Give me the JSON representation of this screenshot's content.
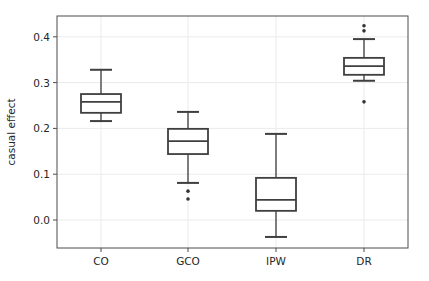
{
  "chart_data": {
    "type": "box",
    "title": "",
    "xlabel": "",
    "ylabel": "casual effect",
    "categories": [
      "CO",
      "GCO",
      "IPW",
      "DR"
    ],
    "ylim": [
      -0.06,
      0.445
    ],
    "yticks": [
      0.0,
      0.1,
      0.2,
      0.3,
      0.4
    ],
    "ytick_labels": [
      "0.0",
      "0.1",
      "0.2",
      "0.3",
      "0.4"
    ],
    "grid": true,
    "legend": null,
    "series": [
      {
        "name": "CO",
        "whisker_low": 0.216,
        "q1": 0.234,
        "median": 0.258,
        "q3": 0.275,
        "whisker_high": 0.328,
        "outliers": []
      },
      {
        "name": "GCO",
        "whisker_low": 0.081,
        "q1": 0.144,
        "median": 0.172,
        "q3": 0.199,
        "whisker_high": 0.236,
        "outliers": [
          0.063,
          0.046
        ]
      },
      {
        "name": "IPW",
        "whisker_low": -0.037,
        "q1": 0.02,
        "median": 0.044,
        "q3": 0.092,
        "whisker_high": 0.188,
        "outliers": []
      },
      {
        "name": "DR",
        "whisker_low": 0.304,
        "q1": 0.317,
        "median": 0.336,
        "q3": 0.354,
        "whisker_high": 0.395,
        "outliers": [
          0.424,
          0.413,
          0.258
        ]
      }
    ],
    "colors": {
      "box": "#3f3f3f",
      "whisker": "#555555",
      "grid": "#ebebeb",
      "frame": "#4d4d4d",
      "background": "#ffffff"
    }
  }
}
